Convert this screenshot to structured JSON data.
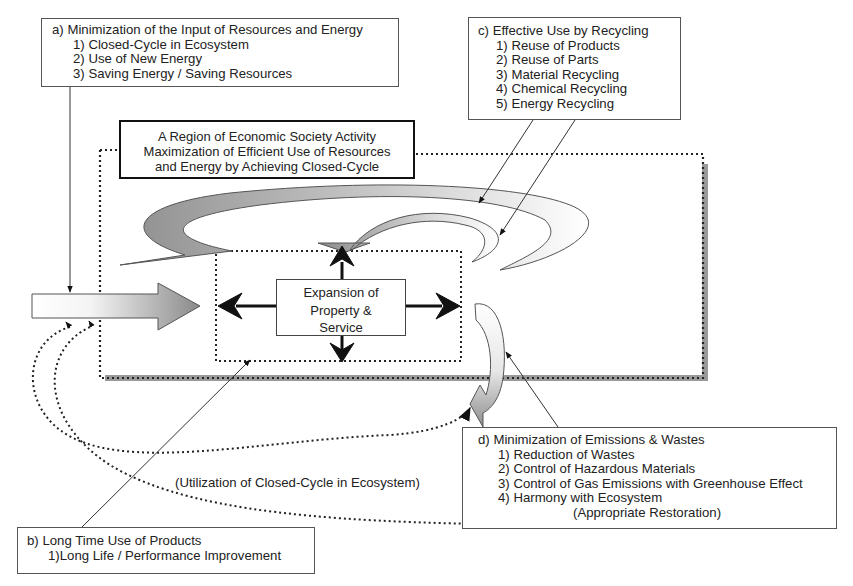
{
  "diagram": {
    "box_a": {
      "title": "a) Minimization of the Input of Resources and Energy",
      "items": [
        "1) Closed-Cycle in Ecosystem",
        "2) Use of New Energy",
        "3) Saving Energy / Saving Resources"
      ]
    },
    "box_b": {
      "title": "b) Long Time Use of Products",
      "items": [
        "1)Long Life / Performance Improvement"
      ]
    },
    "box_c": {
      "title": "c) Effective Use by Recycling",
      "items": [
        "1) Reuse of Products",
        "2) Reuse of Parts",
        "3) Material Recycling",
        "4) Chemical Recycling",
        "5) Energy Recycling"
      ]
    },
    "box_d": {
      "title": "d) Minimization of Emissions & Wastes",
      "items": [
        "1) Reduction of Wastes",
        "2) Control of Hazardous Materials",
        "3) Control of Gas Emissions with Greenhouse Effect",
        "4) Harmony with Ecosystem"
      ],
      "sub": "(Appropriate Restoration)"
    },
    "region": {
      "lines": [
        "A Region of Economic Society Activity",
        "Maximization of Efficient Use of Resources",
        "and Energy by Achieving Closed-Cycle"
      ]
    },
    "center": {
      "lines": [
        "Expansion of",
        "Property &",
        "Service"
      ]
    },
    "ecosystem_label": "(Utilization of Closed-Cycle in Ecosystem)",
    "colors": {
      "line": "#222222",
      "arrow_gray": "#8c8c8c",
      "shadow": "#9a9a9a",
      "background": "#ffffff"
    }
  }
}
